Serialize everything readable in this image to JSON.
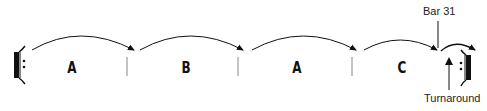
{
  "diagram": {
    "sections": [
      {
        "label": "A",
        "x": 72
      },
      {
        "label": "B",
        "x": 186
      },
      {
        "label": "A",
        "x": 297
      },
      {
        "label": "C",
        "x": 402
      }
    ],
    "annotations": {
      "bar_label": "Bar 31",
      "turnaround_label": "Turnaround"
    },
    "symbols": {
      "start_repeat": "repeat-start-sign",
      "end_repeat": "repeat-end-sign"
    },
    "colors": {
      "ink": "#111111",
      "barline": "#888888"
    }
  }
}
